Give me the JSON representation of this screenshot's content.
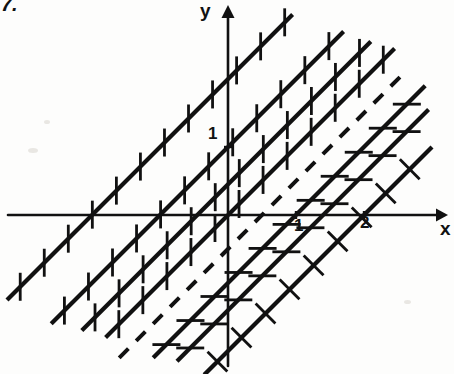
{
  "figure": {
    "number_label": "7.",
    "axis_labels": {
      "x": "x",
      "y": "y"
    },
    "tick_labels": {
      "x1": "1",
      "x2": "2",
      "y1": "1"
    },
    "ink_color": "#111111",
    "background_color": "#fdfdfc"
  },
  "chart_data": {
    "type": "line",
    "title": "",
    "xlabel": "x",
    "ylabel": "y",
    "xlim": [
      -3.4,
      3.3
    ],
    "ylim": [
      -2.3,
      2.3
    ],
    "grid": false,
    "legend": "none",
    "xticks": [
      1,
      2
    ],
    "xticklabels": [
      "1",
      "2"
    ],
    "yticks": [
      1
    ],
    "yticklabels": [
      "1"
    ],
    "annotations": [
      "7."
    ],
    "series": [
      {
        "name": "line-1",
        "slope": 1,
        "intercept": 2.0,
        "x_crossing": -2.0,
        "style": "solid",
        "hatch": "vertical",
        "x": [
          -3.25,
          0.95
        ],
        "y": [
          -1.25,
          2.95
        ]
      },
      {
        "name": "line-2",
        "slope": 1,
        "intercept": 1.0,
        "x_crossing": -1.0,
        "style": "solid",
        "hatch": "vertical",
        "x": [
          -2.6,
          1.7
        ],
        "y": [
          -1.6,
          2.7
        ]
      },
      {
        "name": "line-3",
        "slope": 1,
        "intercept": 0.45,
        "x_crossing": -0.45,
        "style": "solid",
        "hatch": "vertical",
        "x": [
          -2.15,
          2.1
        ],
        "y": [
          -1.7,
          2.55
        ]
      },
      {
        "name": "line-4",
        "slope": 1,
        "intercept": 0.0,
        "x_crossing": 0.0,
        "style": "solid",
        "hatch": "vertical",
        "x": [
          -1.8,
          2.45
        ],
        "y": [
          -1.8,
          2.45
        ]
      },
      {
        "name": "line-5-dashed",
        "slope": 1,
        "intercept": -0.5,
        "x_crossing": 0.5,
        "style": "dashed",
        "hatch": "none",
        "x": [
          -1.6,
          2.6
        ],
        "y": [
          -2.1,
          2.1
        ]
      },
      {
        "name": "line-6",
        "slope": 1,
        "intercept": -1.0,
        "x_crossing": 1.0,
        "style": "solid",
        "hatch": "horizontal",
        "x": [
          -1.1,
          2.9
        ],
        "y": [
          -2.1,
          1.9
        ]
      },
      {
        "name": "line-7",
        "slope": 1,
        "intercept": -1.4,
        "x_crossing": 1.4,
        "style": "solid",
        "hatch": "horizontal",
        "x": [
          -0.75,
          2.95
        ],
        "y": [
          -2.15,
          1.55
        ]
      },
      {
        "name": "line-8",
        "slope": 1,
        "intercept": -2.0,
        "x_crossing": 2.0,
        "style": "solid",
        "hatch": "perpendicular",
        "x": [
          -0.35,
          3.0
        ],
        "y": [
          -2.35,
          1.0
        ]
      }
    ]
  }
}
